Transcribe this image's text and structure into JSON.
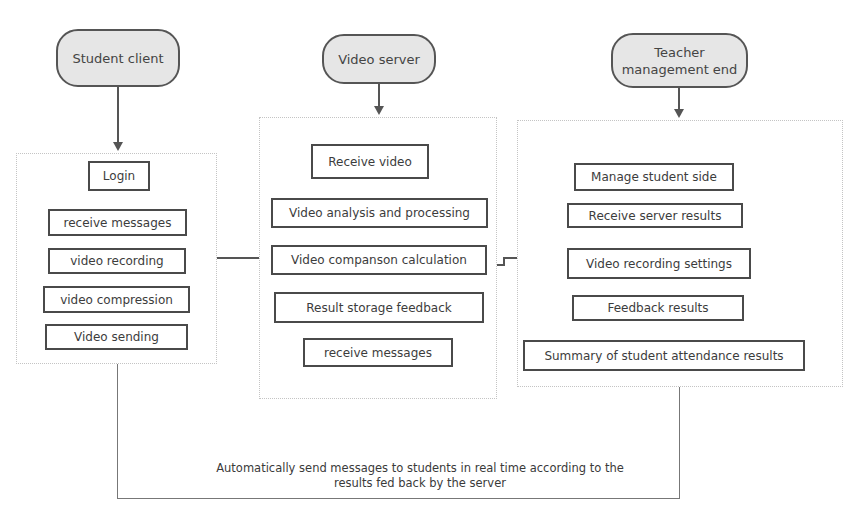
{
  "nodes": {
    "student_client": "Student client",
    "video_server": "Video server",
    "teacher_line1": "Teacher",
    "teacher_line2": "management end"
  },
  "student_panel": {
    "items": [
      "Login",
      "receive messages",
      "video recording",
      "video compression",
      "Video sending"
    ]
  },
  "server_panel": {
    "items": [
      "Receive video",
      "Video analysis and processing",
      "Video companson calculation",
      "Result storage feedback",
      "receive messages"
    ]
  },
  "teacher_panel": {
    "items": [
      "Manage student side",
      "Receive server results",
      "Video recording settings",
      "Feedback results",
      "Summary of student attendance results"
    ]
  },
  "feedback_loop": {
    "line1": "Automatically send messages to students in real time according to the",
    "line2": "results fed back by the server"
  }
}
